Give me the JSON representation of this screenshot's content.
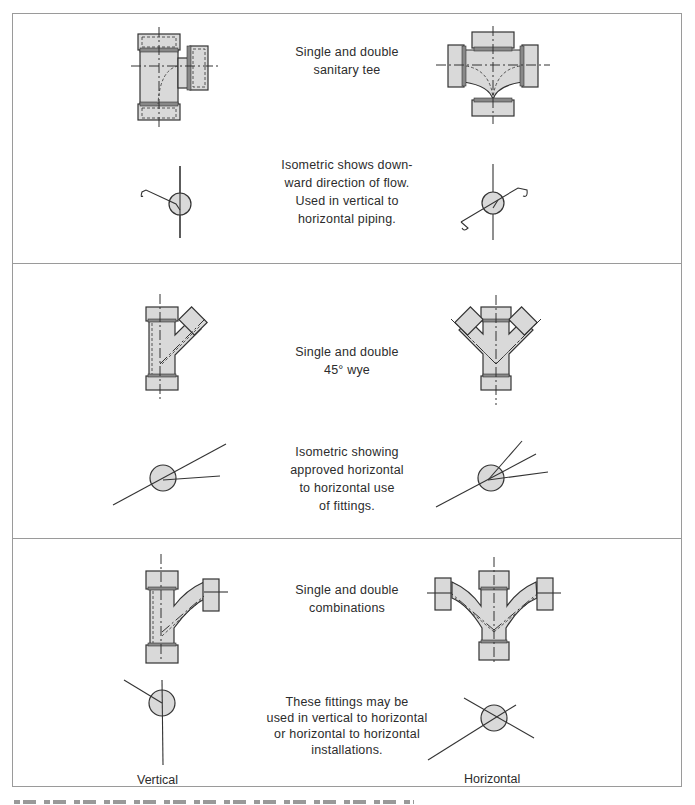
{
  "figure": {
    "panels": [
      {
        "id": "sanitary-tee",
        "title_lines": [
          "Single and double",
          "sanitary tee"
        ],
        "description_lines": [
          "Isometric shows down-",
          "ward direction of flow.",
          "Used in vertical to",
          "horizontal piping."
        ]
      },
      {
        "id": "wye-45",
        "title_lines": [
          "Single and double",
          "45° wye"
        ],
        "description_lines": [
          "Isometric showing",
          "approved horizontal",
          "to horizontal use",
          "of fittings."
        ]
      },
      {
        "id": "combinations",
        "title_lines": [
          "Single and double",
          "combinations"
        ],
        "description_lines": [
          "These fittings may be",
          "used in vertical to horizontal",
          "or horizontal to horizontal",
          "installations."
        ]
      }
    ],
    "column_labels": {
      "left": "Vertical",
      "right": "Horizontal"
    },
    "colors": {
      "fitting_fill": "#d9d9d9",
      "line": "#333333",
      "border": "#9a9a9a"
    }
  }
}
